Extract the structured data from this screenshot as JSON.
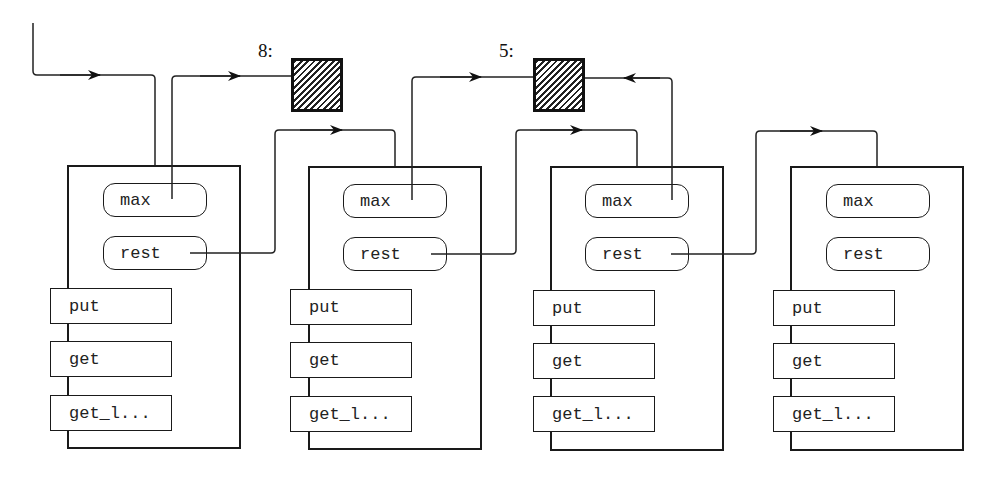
{
  "diagram": {
    "cells": [
      {
        "label": "8:",
        "value_hidden": true
      },
      {
        "label": "5:",
        "value_hidden": true
      }
    ],
    "objects": [
      {
        "attributes": [
          "max",
          "rest"
        ],
        "methods": [
          "put",
          "get",
          "get_l..."
        ]
      },
      {
        "attributes": [
          "max",
          "rest"
        ],
        "methods": [
          "put",
          "get",
          "get_l..."
        ]
      },
      {
        "attributes": [
          "max",
          "rest"
        ],
        "methods": [
          "put",
          "get",
          "get_l..."
        ]
      },
      {
        "attributes": [
          "max",
          "rest"
        ],
        "methods": [
          "put",
          "get",
          "get_l..."
        ]
      }
    ],
    "connections": [
      {
        "from": "external-entry",
        "to": "object-1"
      },
      {
        "from": "object-1.max",
        "to": "cell-8"
      },
      {
        "from": "object-1.rest",
        "to": "object-2"
      },
      {
        "from": "object-2.max",
        "to": "cell-5"
      },
      {
        "from": "object-2.rest",
        "to": "object-3"
      },
      {
        "from": "object-3.max",
        "to": "cell-5"
      },
      {
        "from": "object-3.rest",
        "to": "object-4"
      }
    ]
  }
}
